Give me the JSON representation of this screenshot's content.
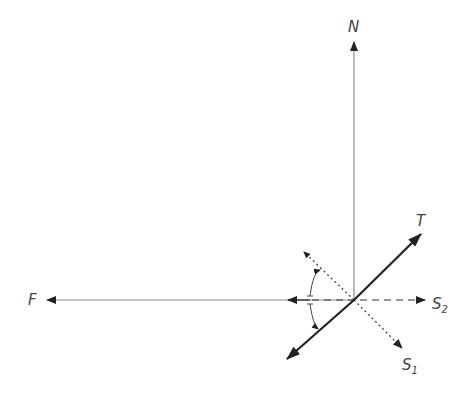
{
  "diagram": {
    "type": "force-diagram",
    "origin": [
      354,
      300
    ],
    "colors": {
      "line": "#222222",
      "thin": "#777777",
      "label": "#444444",
      "background": "#ffffff"
    },
    "vectors": [
      {
        "id": "N",
        "label": "N",
        "style": "thin-solid",
        "from": [
          354,
          300
        ],
        "to": [
          354,
          40
        ],
        "label_pos": [
          348,
          30
        ]
      },
      {
        "id": "F",
        "label": "F",
        "style": "thin-solid",
        "from": [
          354,
          300
        ],
        "to": [
          45,
          300
        ],
        "label_pos": [
          28,
          305
        ]
      },
      {
        "id": "T",
        "label": "T",
        "subscript": "",
        "style": "thick-solid",
        "from": [
          287,
          359
        ],
        "to": [
          422,
          233
        ],
        "label_pos": [
          416,
          225
        ]
      },
      {
        "id": "S2",
        "label": "S",
        "subscript": "2",
        "style": "dashed",
        "from": [
          354,
          300
        ],
        "to": [
          428,
          300
        ],
        "label_pos": [
          432,
          309
        ]
      },
      {
        "id": "S1",
        "label": "S",
        "subscript": "1",
        "style": "dotted",
        "from": [
          305,
          252
        ],
        "to": [
          403,
          349
        ],
        "label_pos": [
          403,
          369
        ]
      }
    ],
    "angle_arc": {
      "description": "angle marks between S1 direction and T direction about horizontal",
      "center": [
        354,
        300
      ]
    }
  }
}
